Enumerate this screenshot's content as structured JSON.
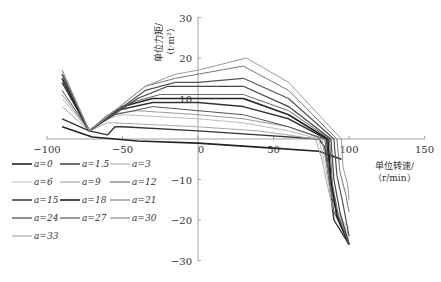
{
  "chart_data": {
    "type": "line",
    "title": "",
    "xlabel": "单位转速/（r/min）",
    "ylabel": "单位力矩/（t·m²）",
    "xlim": [
      -100,
      150
    ],
    "ylim": [
      -30,
      30
    ],
    "x_ticks": [
      -100,
      -50,
      0,
      50,
      100,
      150
    ],
    "y_ticks": [
      -30,
      -20,
      -10,
      10,
      20,
      30
    ],
    "grid": false,
    "legend_position": "lower-left",
    "series": [
      {
        "name": "a=0",
        "color": "#222222",
        "x": [
          -90,
          -70,
          -40,
          0,
          40,
          80,
          95
        ],
        "y": [
          3,
          0.5,
          -0.5,
          -1,
          -2,
          -3,
          -5
        ]
      },
      {
        "name": "a=1.5",
        "color": "#333333",
        "x": [
          -90,
          -72,
          -60,
          -55,
          -50,
          0,
          40,
          80,
          84,
          86,
          88,
          90,
          100
        ],
        "y": [
          5,
          2,
          1,
          3,
          3,
          2,
          1,
          0,
          -2,
          -8,
          -14,
          -20,
          -26
        ]
      },
      {
        "name": "a=3",
        "color": "#aaaaaa",
        "x": [
          -90,
          -72,
          -60,
          -56,
          0,
          40,
          78,
          82,
          86,
          90,
          100
        ],
        "y": [
          8,
          2,
          4,
          4,
          3,
          2,
          0,
          -5,
          -12,
          -18,
          -22
        ]
      },
      {
        "name": "a=6",
        "color": "#bbbbbb",
        "x": [
          -90,
          -72,
          -60,
          -50,
          0,
          30,
          60,
          80,
          84,
          88,
          100
        ],
        "y": [
          10,
          2,
          5,
          6,
          5,
          4,
          2,
          0,
          -6,
          -14,
          -24
        ]
      },
      {
        "name": "a=9",
        "color": "#999999",
        "x": [
          -90,
          -72,
          -60,
          -40,
          0,
          30,
          60,
          82,
          86,
          90,
          100
        ],
        "y": [
          11,
          2,
          6,
          7,
          6,
          5,
          3,
          0,
          -8,
          -16,
          -25
        ]
      },
      {
        "name": "a=12",
        "color": "#555555",
        "x": [
          -90,
          -72,
          -55,
          -30,
          0,
          30,
          60,
          84,
          87,
          90,
          100
        ],
        "y": [
          12,
          2,
          6,
          8,
          7,
          6,
          3,
          0,
          -9,
          -18,
          -26
        ]
      },
      {
        "name": "a=15",
        "color": "#333333",
        "x": [
          -90,
          -72,
          -55,
          -30,
          0,
          30,
          60,
          85,
          88,
          92,
          100
        ],
        "y": [
          14,
          2,
          7,
          9,
          9,
          8,
          5,
          0,
          -10,
          -19,
          -26
        ]
      },
      {
        "name": "a=18",
        "color": "#222222",
        "x": [
          -90,
          -72,
          -50,
          -30,
          0,
          30,
          60,
          86,
          88,
          92,
          100
        ],
        "y": [
          15,
          2,
          8,
          10,
          10,
          10,
          6,
          0,
          -10,
          -19,
          -26
        ]
      },
      {
        "name": "a=21",
        "color": "#666666",
        "x": [
          -90,
          -72,
          -45,
          -25,
          0,
          30,
          60,
          87,
          89,
          93,
          100
        ],
        "y": [
          16,
          2,
          9,
          11,
          11,
          11,
          7,
          0,
          -11,
          -19,
          -26
        ]
      },
      {
        "name": "a=24",
        "color": "#444444",
        "x": [
          -90,
          -72,
          -40,
          -20,
          0,
          30,
          60,
          88,
          90,
          94,
          100
        ],
        "y": [
          16,
          2,
          10,
          13,
          13,
          13,
          8,
          0,
          -10,
          -18,
          -26
        ]
      },
      {
        "name": "a=27",
        "color": "#555555",
        "x": [
          -90,
          -72,
          -35,
          -15,
          0,
          30,
          60,
          90,
          92,
          96,
          100
        ],
        "y": [
          16,
          2,
          12,
          14,
          14,
          15,
          10,
          0,
          -9,
          -16,
          -24
        ]
      },
      {
        "name": "a=30",
        "color": "#777777",
        "x": [
          -90,
          -72,
          -35,
          -15,
          0,
          30,
          60,
          92,
          94,
          98,
          100
        ],
        "y": [
          17,
          2,
          13,
          15,
          16,
          18,
          12,
          0,
          -8,
          -14,
          -18
        ]
      },
      {
        "name": "a=33",
        "color": "#999999",
        "x": [
          -90,
          -72,
          -35,
          -15,
          0,
          32,
          60,
          95,
          96,
          99,
          100
        ],
        "y": [
          17,
          2,
          13,
          16,
          17,
          20,
          14,
          0,
          -7,
          -11,
          -15
        ]
      }
    ]
  },
  "legend": [
    {
      "label": "a=0",
      "color": "#222222",
      "width": 1.6
    },
    {
      "label": "a=1.5",
      "color": "#333333",
      "width": 1.4
    },
    {
      "label": "a=3",
      "color": "#aaaaaa",
      "width": 1
    },
    {
      "label": "a=6",
      "color": "#bbbbbb",
      "width": 1
    },
    {
      "label": "a=9",
      "color": "#999999",
      "width": 1
    },
    {
      "label": "a=12",
      "color": "#555555",
      "width": 1
    },
    {
      "label": "a=15",
      "color": "#333333",
      "width": 1.5
    },
    {
      "label": "a=18",
      "color": "#222222",
      "width": 1.6
    },
    {
      "label": "a=21",
      "color": "#666666",
      "width": 1
    },
    {
      "label": "a=24",
      "color": "#444444",
      "width": 1.2
    },
    {
      "label": "a=27",
      "color": "#555555",
      "width": 1.2
    },
    {
      "label": "a=30",
      "color": "#777777",
      "width": 1
    },
    {
      "label": "a=33",
      "color": "#999999",
      "width": 1
    }
  ],
  "axis": {
    "xlabel_line1": "单位转速/",
    "xlabel_line2": "（r/min）",
    "ylabel_line1": "单位力矩/",
    "ylabel_line2": "（t·m²）"
  }
}
